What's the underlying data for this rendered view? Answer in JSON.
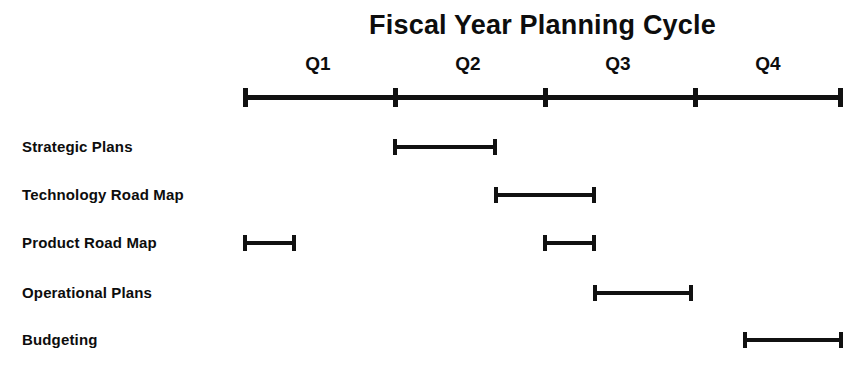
{
  "chart_data": {
    "type": "bar",
    "title": "Fiscal Year Planning Cycle",
    "subtitle": "",
    "xlabel": "",
    "ylabel": "",
    "orientation": "horizontal",
    "grid": false,
    "legend": null,
    "axis": {
      "tick_labels": [
        "Q1",
        "Q2",
        "Q3",
        "Q4"
      ],
      "tick_boundaries": [
        0,
        1,
        2,
        3,
        4
      ],
      "xlim": [
        0,
        4
      ],
      "units": "quarters"
    },
    "categories": [
      "Strategic Plans",
      "Technology Road Map",
      "Product Road Map",
      "Operational Plans",
      "Budgeting"
    ],
    "tasks": [
      {
        "name": "Strategic Plans",
        "segments": [
          {
            "start": 1.0,
            "end": 1.69,
            "start_label": "Q2",
            "end_label": "mid Q2"
          }
        ]
      },
      {
        "name": "Technology Road Map",
        "segments": [
          {
            "start": 1.67,
            "end": 2.35,
            "start_label": "late Q2",
            "end_label": "early Q3"
          }
        ]
      },
      {
        "name": "Product Road Map",
        "segments": [
          {
            "start": 0.0,
            "end": 0.35,
            "start_label": "Q1",
            "end_label": "early Q1"
          },
          {
            "start": 2.0,
            "end": 2.35,
            "start_label": "Q3",
            "end_label": "early Q3"
          }
        ]
      },
      {
        "name": "Operational Plans",
        "segments": [
          {
            "start": 2.33,
            "end": 3.0,
            "start_label": "mid Q3",
            "end_label": "Q4"
          }
        ]
      },
      {
        "name": "Budgeting",
        "segments": [
          {
            "start": 3.33,
            "end": 4.0,
            "start_label": "mid Q4",
            "end_label": "end Q4"
          }
        ]
      }
    ]
  },
  "colors": {
    "background": "#ffffff",
    "ink": "#111111",
    "text": "#0d0d0d"
  },
  "rows": [
    {
      "label": "Strategic Plans"
    },
    {
      "label": "Technology Road Map"
    },
    {
      "label": "Product Road Map"
    },
    {
      "label": "Operational Plans"
    },
    {
      "label": "Budgeting"
    }
  ],
  "quarters": [
    {
      "label": "Q1"
    },
    {
      "label": "Q2"
    },
    {
      "label": "Q3"
    },
    {
      "label": "Q4"
    }
  ],
  "header": {
    "title": "Fiscal Year Planning Cycle"
  }
}
